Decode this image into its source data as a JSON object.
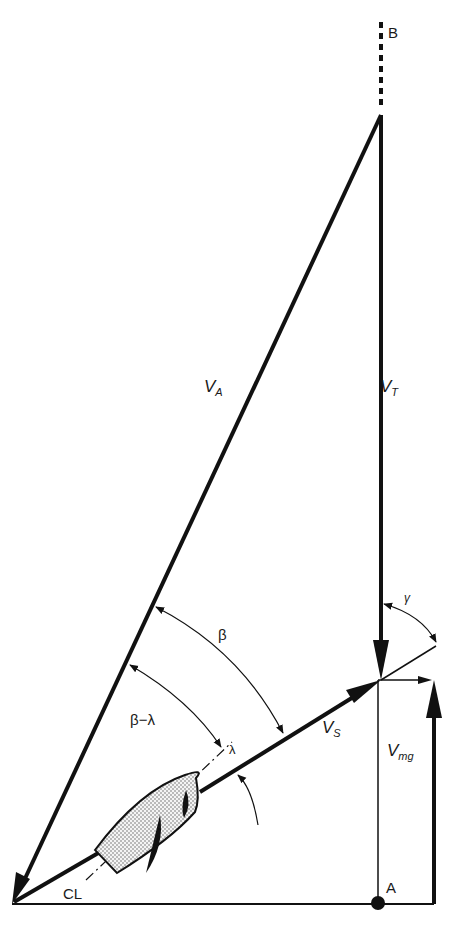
{
  "diagram": {
    "points": {
      "B": "B",
      "A": "A",
      "CL": "CL"
    },
    "vectors": {
      "apparent_wind": {
        "main": "V",
        "sub": "A"
      },
      "true_wind": {
        "main": "V",
        "sub": "T"
      },
      "boat_speed": {
        "main": "V",
        "sub": "S"
      },
      "vmg": {
        "main": "V",
        "sub": "mg"
      }
    },
    "angles": {
      "beta": "β",
      "beta_minus_lambda": "β−λ",
      "lambda": "λ",
      "gamma": "γ"
    },
    "colors": {
      "ink": "#111111",
      "paper": "#ffffff",
      "hull_fill": "#e6e6e6"
    }
  }
}
